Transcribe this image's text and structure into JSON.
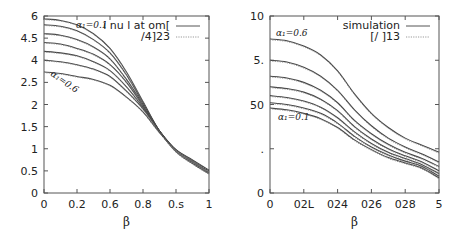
{
  "chart_data": [
    {
      "type": "line",
      "title": "",
      "xlabel": "β",
      "ylabel": "",
      "xlim": [
        0,
        1
      ],
      "ylim": [
        0,
        6
      ],
      "grid": false,
      "legend_position": "top-right",
      "x_tick_labels": [
        "0",
        "0.2",
        "0.6",
        "0.8",
        "0.s",
        "1"
      ],
      "y_tick_labels": [
        "0",
        "0.5",
        "1",
        "1.5",
        "2",
        "2.5",
        "4",
        "4.5",
        "6"
      ],
      "legend": [
        {
          "label": "i nu l at om[",
          "style": "solid"
        },
        {
          "label": "/4]23",
          "style": "dotted"
        }
      ],
      "annotations": [
        {
          "text": "α₁=0.1",
          "position": "top"
        },
        {
          "text": "α₁=0.6",
          "position": "left-middle"
        }
      ],
      "x": [
        0,
        0.1,
        0.2,
        0.3,
        0.4,
        0.5,
        0.6,
        0.7,
        0.8,
        0.9,
        1.0
      ],
      "series": [
        {
          "name": "α1=0.1",
          "values": [
            5.9,
            5.85,
            5.7,
            5.4,
            4.9,
            4.1,
            3.1,
            2.1,
            1.4,
            1.0,
            0.65
          ]
        },
        {
          "name": "α1=0.2",
          "values": [
            5.7,
            5.65,
            5.5,
            5.2,
            4.75,
            4.0,
            3.05,
            2.1,
            1.42,
            1.02,
            0.67
          ]
        },
        {
          "name": "α1=0.3",
          "values": [
            5.4,
            5.35,
            5.2,
            4.95,
            4.55,
            3.85,
            3.0,
            2.1,
            1.43,
            1.04,
            0.69
          ]
        },
        {
          "name": "α1=0.4",
          "values": [
            5.1,
            5.05,
            4.9,
            4.7,
            4.35,
            3.75,
            2.95,
            2.1,
            1.44,
            1.06,
            0.71
          ]
        },
        {
          "name": "α1=0.5",
          "values": [
            4.8,
            4.75,
            4.65,
            4.45,
            4.15,
            3.6,
            2.9,
            2.1,
            1.45,
            1.08,
            0.73
          ]
        },
        {
          "name": "α1=0.55",
          "values": [
            4.5,
            4.45,
            4.35,
            4.2,
            3.95,
            3.45,
            2.85,
            2.1,
            1.46,
            1.1,
            0.75
          ]
        },
        {
          "name": "α1=0.6",
          "values": [
            4.1,
            4.05,
            3.95,
            3.85,
            3.65,
            3.25,
            2.75,
            2.05,
            1.47,
            1.12,
            0.77
          ]
        }
      ]
    },
    {
      "type": "line",
      "title": "",
      "xlabel": "β",
      "ylabel": "",
      "xlim": [
        0,
        5
      ],
      "ylim": [
        0,
        10
      ],
      "grid": false,
      "legend_position": "top-right",
      "x_tick_labels": [
        "0",
        "02L",
        "024",
        "026",
        "028",
        "5"
      ],
      "y_tick_labels": [
        "0",
        ".",
        "50",
        "5.",
        "10"
      ],
      "legend": [
        {
          "label": "simulation",
          "style": "solid"
        },
        {
          "label": "[/ ]13",
          "style": "dotted"
        }
      ],
      "annotations": [
        {
          "text": "α₁=0.6",
          "position": "top-left"
        },
        {
          "text": "α₁=0.1",
          "position": "left-middle"
        }
      ],
      "x": [
        0,
        0.5,
        1.0,
        1.5,
        2.0,
        2.5,
        3.0,
        3.5,
        4.0,
        4.5,
        5.0
      ],
      "series": [
        {
          "name": "α1=0.6",
          "values": [
            8.7,
            8.6,
            8.3,
            7.8,
            6.9,
            5.6,
            4.5,
            3.7,
            3.1,
            2.7,
            2.3
          ]
        },
        {
          "name": "α1=0.5",
          "values": [
            7.5,
            7.4,
            7.1,
            6.6,
            5.8,
            4.7,
            3.8,
            3.1,
            2.6,
            2.2,
            1.75
          ]
        },
        {
          "name": "α1=0.4",
          "values": [
            6.6,
            6.5,
            6.25,
            5.8,
            5.1,
            4.1,
            3.35,
            2.75,
            2.3,
            1.95,
            1.5
          ]
        },
        {
          "name": "α1=0.3",
          "values": [
            6.0,
            5.9,
            5.7,
            5.3,
            4.65,
            3.75,
            3.05,
            2.5,
            2.1,
            1.75,
            1.25
          ]
        },
        {
          "name": "α1=0.2",
          "values": [
            5.5,
            5.4,
            5.2,
            4.85,
            4.25,
            3.45,
            2.8,
            2.3,
            1.95,
            1.6,
            1.1
          ]
        },
        {
          "name": "α1=0.15",
          "values": [
            5.1,
            5.0,
            4.8,
            4.5,
            3.95,
            3.2,
            2.6,
            2.15,
            1.8,
            1.5,
            0.95
          ]
        },
        {
          "name": "α1=0.1",
          "values": [
            4.8,
            4.7,
            4.5,
            4.2,
            3.7,
            3.0,
            2.45,
            2.0,
            1.7,
            1.4,
            0.85
          ]
        }
      ]
    }
  ]
}
